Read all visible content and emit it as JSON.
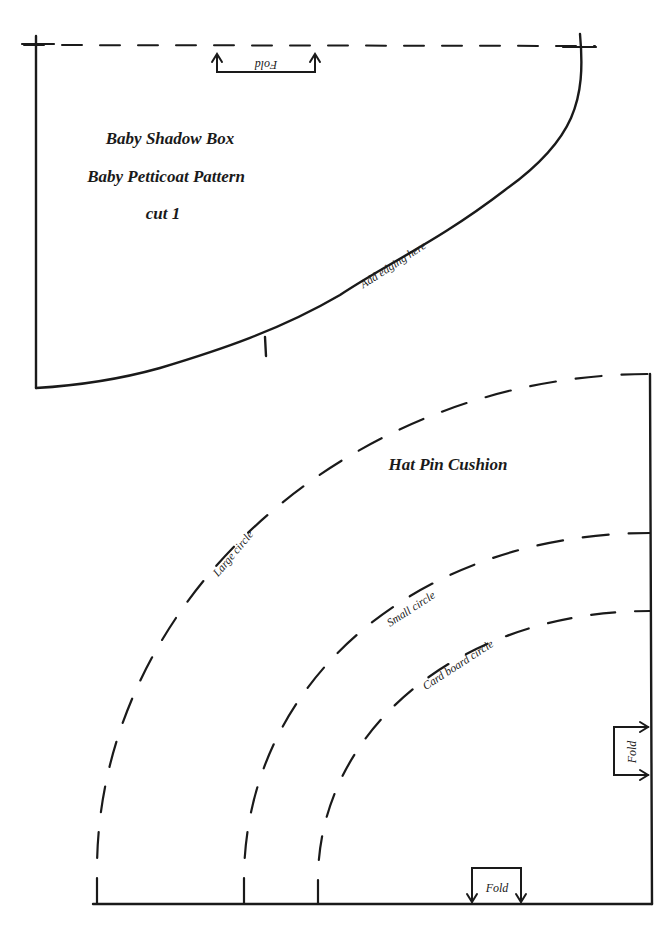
{
  "petticoat_pattern": {
    "title_line_1": "Baby Shadow Box",
    "title_line_2": "Baby Petticoat Pattern",
    "title_line_3": "cut 1",
    "fold_label": "Fold",
    "edging_label": "Add  edging here"
  },
  "hat_pin_cushion": {
    "title": "Hat Pin Cushion",
    "large_circle_label": "Large circle",
    "small_circle_label": "Small circle",
    "card_board_circle_label": "Card board circle",
    "fold_right_label": "Fold",
    "fold_bottom_label": "Fold"
  },
  "colors": {
    "ink": "#1a1a1a",
    "paper": "#ffffff"
  }
}
